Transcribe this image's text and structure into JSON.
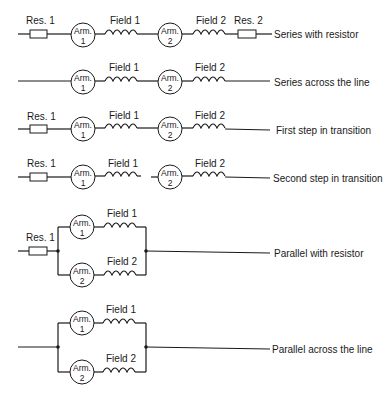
{
  "diagram": {
    "labels": {
      "res1": "Res. 1",
      "res2": "Res. 2",
      "field1": "Field 1",
      "field2": "Field 2",
      "arm": "Arm.",
      "arm1_num": "1",
      "arm2_num": "2"
    },
    "rows": [
      {
        "id": "series-with-resistor",
        "caption": "Series with resistor"
      },
      {
        "id": "series-across-line",
        "caption": "Series across the line"
      },
      {
        "id": "first-step-transition",
        "caption": "First step in transition"
      },
      {
        "id": "second-step-transition",
        "caption": "Second step in transition"
      },
      {
        "id": "parallel-with-resistor",
        "caption": "Parallel with resistor"
      },
      {
        "id": "parallel-across-line",
        "caption": "Parallel across the line"
      }
    ],
    "colors": {
      "ink": "#1a1a1a",
      "background": "#ffffff"
    }
  }
}
